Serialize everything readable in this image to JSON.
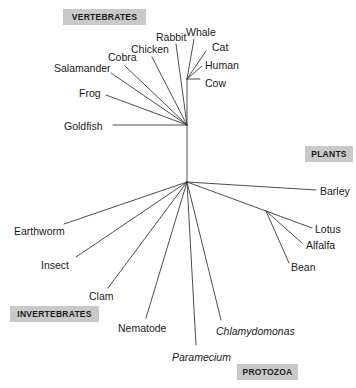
{
  "figure": {
    "type": "unrooted-phylogenetic-tree",
    "width": 356,
    "height": 388,
    "background": "#ffffff",
    "line_color": "#3a3a3a",
    "label_color": "#1a1a1a",
    "group_box_color": "#c9c9c9"
  },
  "group_labels": [
    {
      "name": "vertebrates",
      "text": "VERTEBRATES",
      "x": 63,
      "y": 9,
      "w": 83,
      "h": 16
    },
    {
      "name": "plants",
      "text": "PLANTS",
      "x": 305,
      "y": 146,
      "w": 48,
      "h": 16
    },
    {
      "name": "invertebrates",
      "text": "INVERTEBRATES",
      "x": 10,
      "y": 306,
      "w": 89,
      "h": 16
    },
    {
      "name": "protozoa",
      "text": "PROTOZOA",
      "x": 237,
      "y": 364,
      "w": 61,
      "h": 16
    }
  ],
  "taxa": [
    {
      "name": "whale",
      "text": "Whale",
      "italic": false,
      "label_x": 186,
      "label_y": 27,
      "anchor": "start",
      "tip_x": 194,
      "tip_y": 39,
      "node": "mammals"
    },
    {
      "name": "cat",
      "text": "Cat",
      "italic": false,
      "label_x": 212,
      "label_y": 42,
      "anchor": "start",
      "tip_x": 206,
      "tip_y": 51,
      "node": "mammals"
    },
    {
      "name": "human",
      "text": "Human",
      "italic": false,
      "label_x": 205,
      "label_y": 60,
      "anchor": "start",
      "tip_x": 202,
      "tip_y": 66,
      "node": "mammals"
    },
    {
      "name": "cow",
      "text": "Cow",
      "italic": false,
      "label_x": 205,
      "label_y": 78,
      "anchor": "start",
      "tip_x": 200,
      "tip_y": 79,
      "node": "mammals"
    },
    {
      "name": "rabbit",
      "text": "Rabbit",
      "italic": false,
      "label_x": 156,
      "label_y": 32,
      "anchor": "start",
      "tip_x": 176,
      "tip_y": 44,
      "node": "vertebrate"
    },
    {
      "name": "chicken",
      "text": "Chicken",
      "italic": false,
      "label_x": 131,
      "label_y": 44,
      "anchor": "start",
      "tip_x": 152,
      "tip_y": 57,
      "node": "vertebrate"
    },
    {
      "name": "cobra",
      "text": "Cobra",
      "italic": false,
      "label_x": 108,
      "label_y": 52,
      "anchor": "start",
      "tip_x": 125,
      "tip_y": 66,
      "node": "vertebrate"
    },
    {
      "name": "salamander",
      "text": "Salamander",
      "italic": false,
      "label_x": 54,
      "label_y": 63,
      "anchor": "start",
      "tip_x": 111,
      "tip_y": 73,
      "node": "vertebrate"
    },
    {
      "name": "frog",
      "text": "Frog",
      "italic": false,
      "label_x": 79,
      "label_y": 88,
      "anchor": "start",
      "tip_x": 106,
      "tip_y": 95,
      "node": "vertebrate"
    },
    {
      "name": "goldfish",
      "text": "Goldfish",
      "italic": false,
      "label_x": 64,
      "label_y": 121,
      "anchor": "start",
      "tip_x": 113,
      "tip_y": 125,
      "node": "vertebrate"
    },
    {
      "name": "barley",
      "text": "Barley",
      "italic": false,
      "label_x": 320,
      "label_y": 186,
      "anchor": "start",
      "tip_x": 316,
      "tip_y": 190,
      "node": "root"
    },
    {
      "name": "lotus",
      "text": "Lotus",
      "italic": false,
      "label_x": 315,
      "label_y": 224,
      "anchor": "start",
      "tip_x": 312,
      "tip_y": 228,
      "node": "plants"
    },
    {
      "name": "alfalfa",
      "text": "Alfalfa",
      "italic": false,
      "label_x": 306,
      "label_y": 240,
      "anchor": "start",
      "tip_x": 302,
      "tip_y": 243,
      "node": "plants"
    },
    {
      "name": "bean",
      "text": "Bean",
      "italic": false,
      "label_x": 291,
      "label_y": 262,
      "anchor": "start",
      "tip_x": 289,
      "tip_y": 263,
      "node": "plants"
    },
    {
      "name": "earthworm",
      "text": "Earthworm",
      "italic": false,
      "label_x": 14,
      "label_y": 226,
      "anchor": "start",
      "tip_x": 64,
      "tip_y": 224,
      "node": "root"
    },
    {
      "name": "insect",
      "text": "Insect",
      "italic": false,
      "label_x": 41,
      "label_y": 260,
      "anchor": "start",
      "tip_x": 76,
      "tip_y": 257,
      "node": "root"
    },
    {
      "name": "clam",
      "text": "Clam",
      "italic": false,
      "label_x": 89,
      "label_y": 291,
      "anchor": "start",
      "tip_x": 108,
      "tip_y": 288,
      "node": "root"
    },
    {
      "name": "nematode",
      "text": "Nematode",
      "italic": false,
      "label_x": 118,
      "label_y": 323,
      "anchor": "start",
      "tip_x": 146,
      "tip_y": 318,
      "node": "root"
    },
    {
      "name": "paramecium",
      "text": "Paramecium",
      "italic": true,
      "label_x": 172,
      "label_y": 352,
      "anchor": "start",
      "tip_x": 196,
      "tip_y": 345,
      "node": "root"
    },
    {
      "name": "chlamydomonas",
      "text": "Chlamydomonas",
      "italic": true,
      "label_x": 216,
      "label_y": 326,
      "anchor": "start",
      "tip_x": 221,
      "tip_y": 320,
      "node": "root"
    }
  ],
  "nodes": {
    "mammals": {
      "x": 187,
      "y": 79
    },
    "vertebrate": {
      "x": 187,
      "y": 125
    },
    "root": {
      "x": 187,
      "y": 182
    },
    "plants": {
      "x": 266,
      "y": 211
    }
  },
  "internal_branches": [
    {
      "name": "mammal-stem",
      "from": "vertebrate",
      "to": "mammals"
    },
    {
      "name": "trunk",
      "from": "vertebrate",
      "to": "root"
    },
    {
      "name": "plant-stem",
      "from": "root",
      "to": "plants"
    }
  ]
}
